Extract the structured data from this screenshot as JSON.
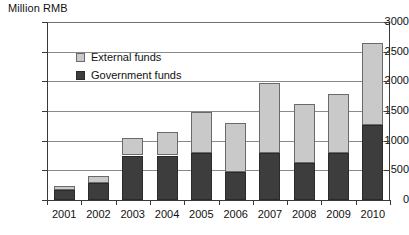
{
  "chart_data": {
    "type": "bar",
    "title": "",
    "ylabel": "Million RMB",
    "xlabel": "",
    "stacked": true,
    "grid": true,
    "legend_position": "inside-top-left",
    "ylim": [
      0,
      3000
    ],
    "yticks": [
      0,
      500,
      1000,
      1500,
      2000,
      2500,
      3000
    ],
    "ytick_labels": [
      "0",
      "500",
      "1000",
      "1500",
      "2000",
      "2500",
      "3000"
    ],
    "categories": [
      "2001",
      "2002",
      "2003",
      "2004",
      "2005",
      "2006",
      "2007",
      "2008",
      "2009",
      "2010"
    ],
    "series": [
      {
        "name": "Government funds",
        "color": "#3d3d3d",
        "values": [
          170,
          280,
          750,
          750,
          790,
          470,
          800,
          620,
          790,
          1260
        ]
      },
      {
        "name": "External funds",
        "color": "#c9c9c9",
        "values": [
          70,
          120,
          290,
          400,
          700,
          820,
          1180,
          990,
          990,
          1380
        ]
      }
    ],
    "totals": [
      240,
      400,
      1040,
      1150,
      1490,
      1290,
      1980,
      1610,
      1780,
      2640
    ]
  },
  "legend": {
    "items": [
      {
        "label": "External funds",
        "swatch": "light-gray"
      },
      {
        "label": "Government funds",
        "swatch": "dark-gray"
      }
    ]
  }
}
